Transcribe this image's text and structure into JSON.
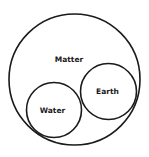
{
  "diagram": {
    "type": "euler-diagram",
    "canvas": {
      "width": 149,
      "height": 157
    },
    "stroke_color": "#1a1a1a",
    "sets": [
      {
        "id": "matter",
        "label": "Matter",
        "cx": 74.5,
        "cy": 79.5,
        "r": 65.5,
        "label_x": 69,
        "label_y": 62
      },
      {
        "id": "earth",
        "label": "Earth",
        "cx": 108.5,
        "cy": 91.5,
        "r": 28,
        "label_x": 107.5,
        "label_y": 94
      },
      {
        "id": "water",
        "label": "Water",
        "cx": 54,
        "cy": 110,
        "r": 27.5,
        "label_x": 52.5,
        "label_y": 113
      }
    ],
    "relations": [
      {
        "subset": "Earth",
        "superset": "Matter"
      },
      {
        "subset": "Water",
        "superset": "Matter"
      },
      {
        "disjoint": [
          "Earth",
          "Water"
        ]
      }
    ]
  }
}
